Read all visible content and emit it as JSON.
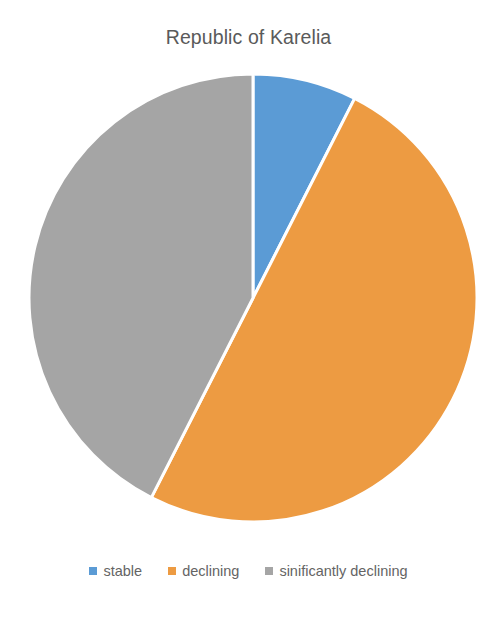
{
  "chart_data": {
    "type": "pie",
    "title": "Republic of Karelia",
    "subtitle": "",
    "xlabel": "",
    "ylabel": "",
    "grid": false,
    "legend_position": "bottom",
    "start_angle_deg": 0,
    "direction": "clockwise",
    "categories": [
      "stable",
      "declining",
      "sinificantly declining"
    ],
    "values": [
      7.5,
      50.0,
      42.5
    ],
    "colors": [
      "#5B9BD5",
      "#ED9B42",
      "#A5A5A5"
    ],
    "slices": [
      {
        "label": "stable",
        "value": 7.5,
        "color": "#5B9BD5",
        "start_angle_deg": 0,
        "end_angle_deg": 27
      },
      {
        "label": "declining",
        "value": 50.0,
        "color": "#ED9B42",
        "start_angle_deg": 27,
        "end_angle_deg": 207
      },
      {
        "label": "sinificantly declining",
        "value": 42.5,
        "color": "#A5A5A5",
        "start_angle_deg": 207,
        "end_angle_deg": 360
      }
    ],
    "geometry": {
      "center_x": 253,
      "center_y": 238,
      "radius": 224,
      "separator_color": "#FFFFFF",
      "separator_width": 3
    },
    "annotations": [],
    "data_labels_shown": false
  },
  "title": {
    "text": "Republic of Karelia",
    "color": "#5A5A5A"
  },
  "legend": {
    "items": [
      {
        "label": "stable",
        "color": "#5B9BD5"
      },
      {
        "label": "declining",
        "color": "#ED9B42"
      },
      {
        "label": "sinificantly declining",
        "color": "#A5A5A5"
      }
    ],
    "text_color": "#646464"
  },
  "canvas": {
    "background": "#FFFFFF",
    "width": 497,
    "height": 622
  }
}
